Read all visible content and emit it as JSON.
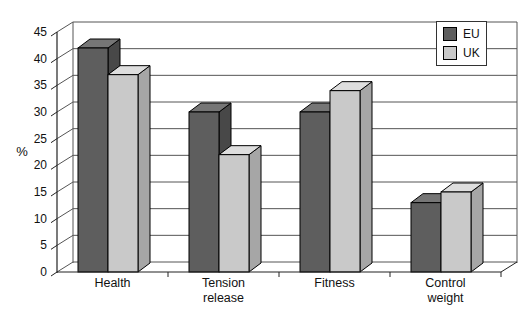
{
  "page": {
    "background": "#ffffff"
  },
  "chart_data": {
    "type": "bar",
    "projection": "3d-clustered",
    "title": "",
    "xlabel": "",
    "ylabel": "%",
    "ylim": [
      0,
      45
    ],
    "ytick_step": 5,
    "ytick_labels": [
      "0",
      "5",
      "10",
      "15",
      "20",
      "25",
      "30",
      "35",
      "40",
      "45"
    ],
    "categories": [
      "Health",
      "Tension release",
      "Fitness",
      "Control weight"
    ],
    "series": [
      {
        "name": "EU",
        "values": [
          42,
          30,
          30,
          13
        ]
      },
      {
        "name": "UK",
        "values": [
          37,
          22,
          34,
          15
        ]
      }
    ],
    "legend": {
      "position": "top-right",
      "entries": [
        "EU",
        "UK"
      ]
    },
    "grid": true,
    "colors": {
      "eu_front": "#5e5e5e",
      "eu_top": "#767676",
      "eu_side": "#484848",
      "uk_front": "#c9c9c9",
      "uk_top": "#dedede",
      "uk_side": "#a6a6a6",
      "grid": "#555555",
      "frame": "#222222",
      "text": "#111111",
      "legend_border": "#333333",
      "background": "#ffffff"
    }
  }
}
